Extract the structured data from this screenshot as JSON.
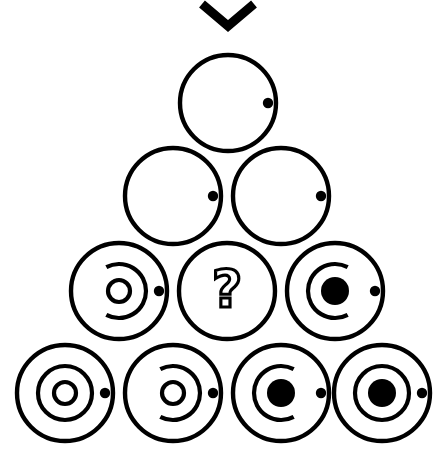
{
  "canvas": {
    "width": 442,
    "height": 462,
    "background": "#ffffff",
    "ink": "#000000"
  },
  "figure": {
    "marker": {
      "name": "chevron-down-marker",
      "label": "v",
      "x": 228,
      "y": 4,
      "half_width": 26,
      "depth": 22,
      "stroke_width": 9
    },
    "missing_cell_symbol": "?",
    "rows": [
      {
        "index": 1,
        "count": 1,
        "cy": 103,
        "radius": 48,
        "cells": [
          {
            "id": "r1c1",
            "name": "orbit-empty-dot",
            "cx": 228,
            "ring": "none",
            "core": "none",
            "satellite": true,
            "satellite_r": 5.2,
            "satellite_offset": 40,
            "is_missing": false
          }
        ]
      },
      {
        "index": 2,
        "count": 2,
        "cy": 196,
        "radius": 48,
        "cells": [
          {
            "id": "r2c1",
            "name": "orbit-empty-dot",
            "cx": 173,
            "ring": "none",
            "core": "none",
            "satellite": true,
            "satellite_r": 5.2,
            "satellite_offset": 40,
            "is_missing": false
          },
          {
            "id": "r2c2",
            "name": "orbit-empty-dot",
            "cx": 281,
            "ring": "none",
            "core": "none",
            "satellite": true,
            "satellite_r": 5.2,
            "satellite_offset": 40,
            "is_missing": false
          }
        ]
      },
      {
        "index": 3,
        "count": 3,
        "cy": 291,
        "radius": 48,
        "cells": [
          {
            "id": "r3c1",
            "name": "orbit-arc-open-left-hollow-core",
            "cx": 119,
            "ring": "arc-open-left",
            "core": "hollow",
            "core_r": 11,
            "satellite": true,
            "satellite_r": 5.2,
            "satellite_offset": 40,
            "is_missing": false
          },
          {
            "id": "r3c2",
            "name": "missing-cell",
            "cx": 227,
            "ring": "none",
            "core": "question",
            "satellite": false,
            "is_missing": true
          },
          {
            "id": "r3c3",
            "name": "orbit-arc-open-right-filled-core",
            "cx": 335,
            "ring": "arc-open-right",
            "core": "filled",
            "core_r": 14,
            "satellite": true,
            "satellite_r": 5.2,
            "satellite_offset": 40,
            "is_missing": false
          }
        ]
      },
      {
        "index": 4,
        "count": 4,
        "cy": 393,
        "radius": 48,
        "cells": [
          {
            "id": "r4c1",
            "name": "orbit-full-ring-hollow-core",
            "cx": 65,
            "ring": "full",
            "core": "hollow",
            "core_r": 11,
            "satellite": true,
            "satellite_r": 5.2,
            "satellite_offset": 40,
            "is_missing": false
          },
          {
            "id": "r4c2",
            "name": "orbit-arc-open-left-hollow-core",
            "cx": 173,
            "ring": "arc-open-left",
            "core": "hollow",
            "core_r": 11,
            "satellite": true,
            "satellite_r": 5.2,
            "satellite_offset": 40,
            "is_missing": false
          },
          {
            "id": "r4c3",
            "name": "orbit-arc-open-right-filled-core",
            "cx": 281,
            "ring": "arc-open-right",
            "core": "filled",
            "core_r": 14,
            "satellite": true,
            "satellite_r": 5.2,
            "satellite_offset": 40,
            "is_missing": false
          },
          {
            "id": "r4c4",
            "name": "orbit-full-ring-filled-core",
            "cx": 382,
            "ring": "full",
            "core": "filled",
            "core_r": 14,
            "satellite": true,
            "satellite_r": 5.2,
            "satellite_offset": 40,
            "is_missing": false
          }
        ]
      }
    ],
    "style": {
      "outer_stroke_width": 4.4,
      "ring_radius": 27,
      "ring_stroke_width": 4.2,
      "core_stroke_width": 4.2
    }
  }
}
